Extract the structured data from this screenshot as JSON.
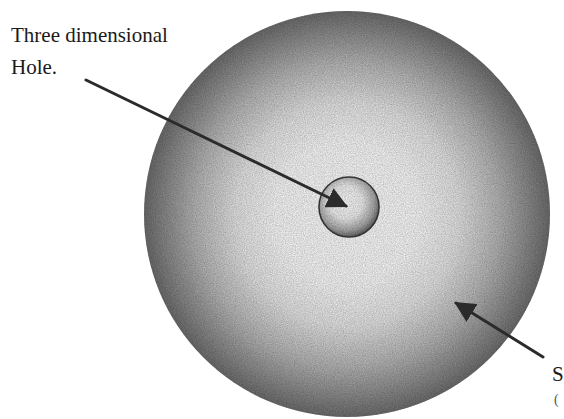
{
  "diagram": {
    "type": "labeled-illustration",
    "labels": {
      "hole": {
        "line1": "Three dimensional",
        "line2": "Hole."
      },
      "sphere": {
        "line1": "S",
        "line2": "("
      }
    },
    "shapes": {
      "outer_sphere": {
        "cx": 347,
        "cy": 214,
        "r": 203,
        "center_color": "#ffffff",
        "edge_color": "#6e6e6e"
      },
      "inner_hole": {
        "cx": 349,
        "cy": 207,
        "r": 30,
        "center_color": "#ffffff",
        "edge_color": "#5a5a5a",
        "outline_color": "#333333"
      }
    },
    "arrows": [
      {
        "name": "hole-pointer",
        "from": [
          86,
          80
        ],
        "to": [
          349,
          207
        ],
        "color": "#2b2b2b"
      },
      {
        "name": "sphere-pointer",
        "from": [
          543,
          357
        ],
        "to": [
          453,
          301
        ],
        "color": "#2b2b2b"
      }
    ]
  }
}
